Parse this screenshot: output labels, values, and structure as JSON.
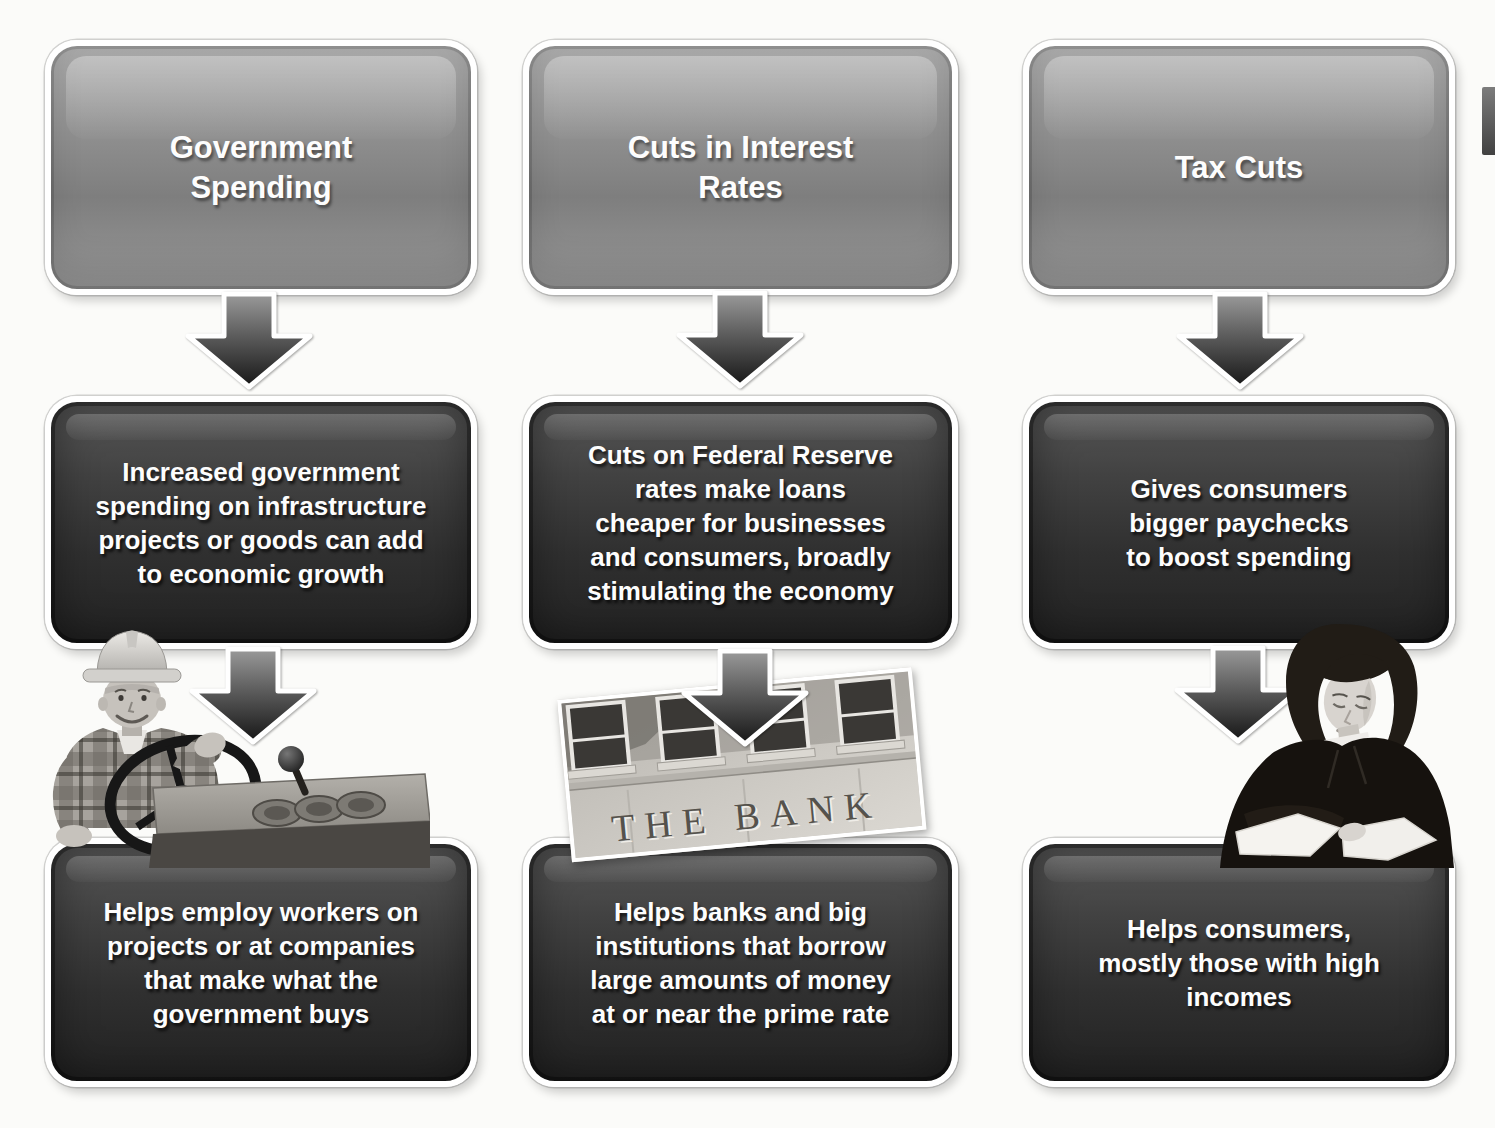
{
  "diagram": {
    "title_implied": "",
    "columns": [
      {
        "header": "Government\nSpending",
        "mechanism": "Increased government\nspending on infrastructure\nprojects or goods can add\nto economic growth",
        "outcome": "Helps employ workers on\nprojects or at companies\nthat make what the\ngovernment buys",
        "photo": "construction-worker-operating-machinery"
      },
      {
        "header": "Cuts in Interest\nRates",
        "mechanism": "Cuts on Federal Reserve\nrates make loans\ncheaper for businesses\nand consumers, broadly\nstimulating the economy",
        "outcome": "Helps banks and big\ninstitutions that borrow\nlarge amounts of money\nat or near the prime rate",
        "photo": "bank-building-facade",
        "photo_text": "THE BANK"
      },
      {
        "header": "Tax Cuts",
        "mechanism": "Gives consumers\nbigger paychecks\nto boost spending",
        "outcome": "Helps consumers,\nmostly those with high\nincomes",
        "photo": "businesswoman-reviewing-paperwork"
      }
    ],
    "icons": {
      "flow_arrow": "down-block-arrow-icon"
    },
    "colors": {
      "header_box": "#8e8e8e",
      "content_box": "#2f2f2f",
      "box_border": "#ffffff",
      "text": "#fdfdfd",
      "background": "#fbfbf9",
      "arrow_fill_top": "#9a9a9a",
      "arrow_fill_bottom": "#161616"
    }
  }
}
